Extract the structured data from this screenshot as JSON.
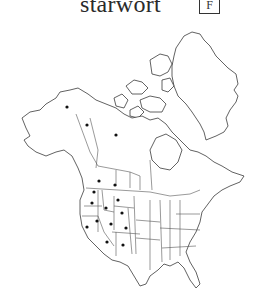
{
  "header": {
    "title": "starwort",
    "badge": "F"
  },
  "map": {
    "region": "North America",
    "dot_color": "#111111",
    "occurrence_dots": [
      {
        "region": "Alaska",
        "x": 67,
        "y": 107
      },
      {
        "region": "Yukon",
        "x": 87,
        "y": 125
      },
      {
        "region": "Northwest Territories",
        "x": 116,
        "y": 135
      },
      {
        "region": "British Columbia",
        "x": 99,
        "y": 181
      },
      {
        "region": "Alberta",
        "x": 115,
        "y": 185
      },
      {
        "region": "Washington",
        "x": 94,
        "y": 192
      },
      {
        "region": "Oregon",
        "x": 92,
        "y": 203
      },
      {
        "region": "Montana",
        "x": 118,
        "y": 200
      },
      {
        "region": "Idaho",
        "x": 106,
        "y": 208
      },
      {
        "region": "Wyoming",
        "x": 122,
        "y": 213
      },
      {
        "region": "Nevada",
        "x": 97,
        "y": 221
      },
      {
        "region": "California",
        "x": 87,
        "y": 227
      },
      {
        "region": "Utah",
        "x": 111,
        "y": 224
      },
      {
        "region": "Colorado",
        "x": 126,
        "y": 228
      },
      {
        "region": "Arizona",
        "x": 107,
        "y": 242
      },
      {
        "region": "New Mexico",
        "x": 123,
        "y": 245
      }
    ]
  }
}
